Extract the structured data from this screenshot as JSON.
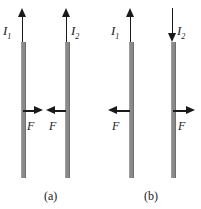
{
  "figure": {
    "type": "physics-diagram",
    "panels": [
      {
        "id": "a",
        "caption": "(a)",
        "caption_x": 44,
        "caption_y": 190,
        "currents": [
          {
            "name": "current-1",
            "label": "I",
            "subscript": "1",
            "direction": "up",
            "arrow_x": 17,
            "arrow_y": 8,
            "arrow_height": 34,
            "label_x": 3,
            "label_y": 24
          },
          {
            "name": "current-2",
            "label": "I",
            "subscript": "2",
            "direction": "up",
            "arrow_x": 61,
            "arrow_y": 8,
            "arrow_height": 34,
            "label_x": 71,
            "label_y": 24
          }
        ],
        "wires": [
          {
            "name": "wire-1",
            "x": 21,
            "y": 42,
            "height": 136
          },
          {
            "name": "wire-2",
            "x": 65,
            "y": 42,
            "height": 136
          }
        ],
        "forces": [
          {
            "name": "force-on-wire-1",
            "label": "F",
            "direction": "right",
            "x": 23,
            "y": 106,
            "width": 20,
            "label_x": 27,
            "label_y": 120
          },
          {
            "name": "force-on-wire-2",
            "label": "F",
            "direction": "left",
            "x": 46,
            "y": 106,
            "width": 20,
            "label_x": 49,
            "label_y": 120
          }
        ],
        "interaction": "attraction"
      },
      {
        "id": "b",
        "caption": "(b)",
        "caption_x": 144,
        "caption_y": 190,
        "currents": [
          {
            "name": "current-1",
            "label": "I",
            "subscript": "1",
            "direction": "up",
            "arrow_x": 125,
            "arrow_y": 8,
            "arrow_height": 34,
            "label_x": 111,
            "label_y": 24
          },
          {
            "name": "current-2",
            "label": "I",
            "subscript": "2",
            "direction": "down",
            "arrow_x": 167,
            "arrow_y": 8,
            "arrow_height": 34,
            "label_x": 177,
            "label_y": 24
          }
        ],
        "wires": [
          {
            "name": "wire-1",
            "x": 129,
            "y": 42,
            "height": 136
          },
          {
            "name": "wire-2",
            "x": 171,
            "y": 42,
            "height": 136
          }
        ],
        "forces": [
          {
            "name": "force-on-wire-1",
            "label": "F",
            "direction": "left",
            "x": 108,
            "y": 106,
            "width": 22,
            "label_x": 112,
            "label_y": 120
          },
          {
            "name": "force-on-wire-2",
            "label": "F",
            "direction": "right",
            "x": 173,
            "y": 106,
            "width": 22,
            "label_x": 178,
            "label_y": 120
          }
        ],
        "interaction": "repulsion"
      }
    ],
    "colors": {
      "wire": "#8a8a8a",
      "arrow": "#1a1a1a",
      "text": "#1a1a1a",
      "background": "#ffffff"
    }
  }
}
